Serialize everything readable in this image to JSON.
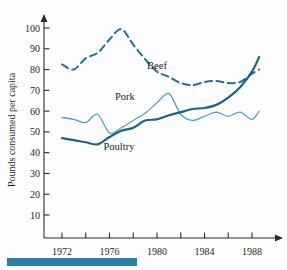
{
  "chart_data": {
    "type": "line",
    "title": "",
    "subtitle": "",
    "xlabel": "",
    "ylabel": "Pounds consumed per capita",
    "xlim": [
      1971,
      1989
    ],
    "ylim": [
      0,
      105
    ],
    "grid": false,
    "legend_position": "inline-annotations",
    "x_ticks": [
      1972,
      1973,
      1974,
      1975,
      1976,
      1977,
      1978,
      1979,
      1980,
      1981,
      1982,
      1983,
      1984,
      1985,
      1986,
      1987,
      1988
    ],
    "x_tick_labels": [
      "1972",
      "",
      "1974",
      "",
      "1976",
      "",
      "1978",
      "",
      "1980",
      "",
      "1982",
      "",
      "1984",
      "",
      "1986",
      "",
      "1988"
    ],
    "x_major_labels": [
      "1972",
      "1976",
      "1980",
      "1984",
      "1988"
    ],
    "y_ticks": [
      10,
      20,
      30,
      40,
      50,
      60,
      70,
      80,
      90,
      100
    ],
    "y_tick_labels": [
      "10",
      "20",
      "30",
      "40",
      "50",
      "60",
      "70",
      "80",
      "90",
      "100"
    ],
    "x": [
      1972,
      1973,
      1974,
      1975,
      1976,
      1977,
      1978,
      1979,
      1980,
      1981,
      1982,
      1983,
      1984,
      1985,
      1986,
      1987,
      1988,
      1988.6
    ],
    "series": [
      {
        "name": "Beef",
        "label": "Beef",
        "color": "#2a6f93",
        "style": "dashed",
        "width": 2.0,
        "annotation": {
          "text": "Beef",
          "x": 1980.0,
          "y": 80.5
        },
        "values": [
          82.5,
          80.0,
          85.5,
          88.0,
          94.5,
          99.5,
          92.0,
          85.0,
          79.0,
          76.5,
          73.5,
          72.5,
          74.0,
          74.5,
          73.5,
          74.0,
          78.0,
          80.0
        ]
      },
      {
        "name": "Pork",
        "label": "Pork",
        "color": "#5b9dbd",
        "style": "solid",
        "width": 1.3,
        "annotation": {
          "text": "Pork",
          "x": 1977.3,
          "y": 65.5
        },
        "values": [
          57.0,
          56.0,
          54.5,
          58.5,
          49.5,
          52.0,
          55.5,
          59.0,
          64.0,
          68.5,
          58.5,
          55.5,
          57.5,
          59.5,
          57.5,
          59.5,
          56.0,
          60.0
        ]
      },
      {
        "name": "Poultry",
        "label": "Poultry",
        "color": "#1c6285",
        "style": "solid",
        "width": 2.2,
        "annotation": {
          "text": "Poultry",
          "x": 1976.8,
          "y": 41.5
        },
        "values": [
          47.0,
          46.0,
          45.0,
          44.0,
          47.5,
          50.5,
          52.0,
          55.5,
          56.0,
          58.0,
          59.5,
          61.0,
          61.5,
          63.0,
          66.5,
          71.5,
          79.0,
          86.0
        ]
      }
    ]
  },
  "footer": {
    "bar_color": "#2e7fa8"
  }
}
